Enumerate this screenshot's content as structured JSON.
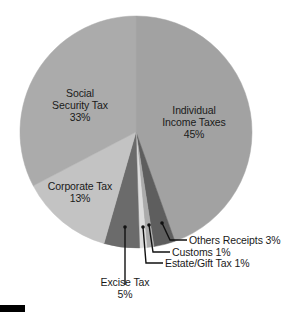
{
  "chart_data": {
    "type": "pie",
    "title": "",
    "start_angle_deg": 0,
    "direction": "clockwise",
    "center": [
      136,
      132
    ],
    "radius": 116,
    "slices": [
      {
        "name": "Individual Income Taxes",
        "label_lines": [
          "Individual",
          "Income Taxes"
        ],
        "value": 45,
        "pct_label": "45%",
        "color": "#a2a2a2"
      },
      {
        "name": "Others Receipts",
        "label_lines": [
          "Others Receipts 3%"
        ],
        "value": 3,
        "pct_label": "3%",
        "color": "#5e5e5e"
      },
      {
        "name": "Customs",
        "label_lines": [
          "Customs 1%"
        ],
        "value": 1,
        "pct_label": "1%",
        "color": "#ababab"
      },
      {
        "name": "Estate/Gift Tax",
        "label_lines": [
          "Estate/Gift Tax 1%"
        ],
        "value": 1,
        "pct_label": "1%",
        "color": "#dcdcdc"
      },
      {
        "name": "Excise Tax",
        "label_lines": [
          "Excise Tax"
        ],
        "value": 5,
        "pct_label": "5%",
        "color": "#6b6b6b"
      },
      {
        "name": "Corporate Tax",
        "label_lines": [
          "Corporate Tax"
        ],
        "value": 13,
        "pct_label": "13%",
        "color": "#c3c3c3"
      },
      {
        "name": "Social Security Tax",
        "label_lines": [
          "Social",
          "Security Tax"
        ],
        "value": 33,
        "pct_label": "33%",
        "color": "#ababab"
      }
    ],
    "legend": "none (direct labels with leader lines)"
  },
  "labels": {
    "individual": {
      "line1": "Individual",
      "line2": "Income Taxes",
      "pct": "45%"
    },
    "social": {
      "line1": "Social",
      "line2": "Security Tax",
      "pct": "33%"
    },
    "corporate": {
      "line1": "Corporate Tax",
      "pct": "13%"
    },
    "excise": {
      "line1": "Excise Tax",
      "pct": "5%"
    },
    "estate": {
      "text": "Estate/Gift Tax 1%"
    },
    "customs": {
      "text": "Customs 1%"
    },
    "others": {
      "text": "Others Receipts 3%"
    }
  }
}
